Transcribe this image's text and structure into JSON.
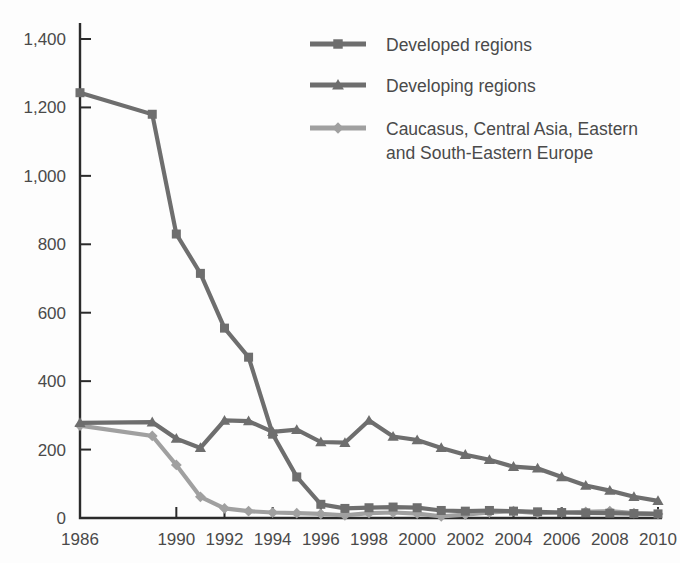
{
  "chart_data": {
    "type": "line",
    "title": "",
    "xlabel": "",
    "ylabel": "",
    "xlim": [
      1986,
      2010
    ],
    "ylim": [
      0,
      1400
    ],
    "grid": false,
    "legend_position": "top-right",
    "y_ticks": [
      "0",
      "200",
      "400",
      "600",
      "800",
      "1,000",
      "1,200",
      "1,400"
    ],
    "y_tick_values": [
      0,
      200,
      400,
      600,
      800,
      1000,
      1200,
      1400
    ],
    "x_ticks": [
      "1986",
      "1990",
      "1992",
      "1994",
      "1996",
      "1998",
      "2000",
      "2002",
      "2004",
      "2006",
      "2008",
      "2010"
    ],
    "x_tick_values": [
      1986,
      1990,
      1992,
      1994,
      1996,
      1998,
      2000,
      2002,
      2004,
      2006,
      2008,
      2010
    ],
    "x": [
      1986,
      1989,
      1990,
      1991,
      1992,
      1993,
      1994,
      1995,
      1996,
      1997,
      1998,
      1999,
      2000,
      2001,
      2002,
      2003,
      2004,
      2005,
      2006,
      2007,
      2008,
      2009,
      2010
    ],
    "series": [
      {
        "name": "Developed regions",
        "color": "#6e6e6e",
        "marker": "square",
        "values": [
          1243,
          1180,
          830,
          715,
          555,
          470,
          245,
          120,
          40,
          28,
          30,
          32,
          30,
          22,
          20,
          22,
          20,
          18,
          16,
          15,
          14,
          13,
          12
        ]
      },
      {
        "name": "Developing regions",
        "color": "#6e6e6e",
        "marker": "triangle",
        "values": [
          278,
          280,
          232,
          205,
          285,
          283,
          252,
          258,
          222,
          220,
          285,
          238,
          228,
          205,
          185,
          170,
          150,
          145,
          120,
          95,
          80,
          62,
          50
        ]
      },
      {
        "name": "Caucasus, Central Asia, Eastern and South-Eastern Europe",
        "color": "#a0a0a0",
        "marker": "diamond",
        "values": [
          270,
          240,
          155,
          62,
          28,
          20,
          16,
          14,
          12,
          8,
          14,
          16,
          13,
          5,
          10,
          16,
          20,
          14,
          16,
          18,
          20,
          14,
          12
        ]
      }
    ]
  },
  "legend": {
    "items": [
      {
        "label": "Developed regions",
        "marker": "square-marker-icon"
      },
      {
        "label": "Developing regions",
        "marker": "triangle-marker-icon"
      },
      {
        "label": "Caucasus, Central Asia, Eastern",
        "label2": "and South-Eastern Europe",
        "marker": "diamond-marker-icon"
      }
    ]
  }
}
